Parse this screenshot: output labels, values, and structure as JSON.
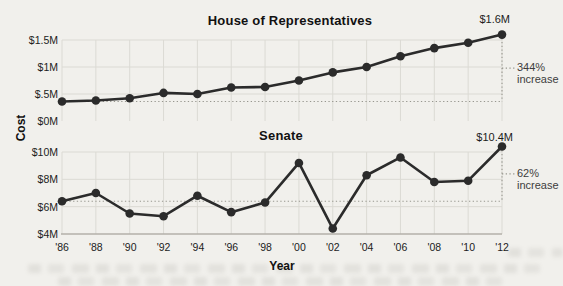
{
  "figure": {
    "y_axis_title": "Cost",
    "x_axis_title": "Year",
    "colors": {
      "line": "#2b2b2b",
      "grid": "#dbdad4",
      "dotted": "#98978f",
      "axis": "#b3b1aa",
      "background": "#f1f0ec"
    }
  },
  "chart_data": [
    {
      "type": "line",
      "title": "House of Representatives",
      "categories": [
        "'86",
        "'88",
        "'90",
        "'92",
        "'94",
        "'96",
        "'98",
        "'00",
        "'02",
        "'04",
        "'06",
        "'08",
        "'10",
        "'12"
      ],
      "x": [
        1986,
        1988,
        1990,
        1992,
        1994,
        1996,
        1998,
        2000,
        2002,
        2004,
        2006,
        2008,
        2010,
        2012
      ],
      "values": [
        0.36,
        0.38,
        0.42,
        0.52,
        0.5,
        0.62,
        0.63,
        0.75,
        0.9,
        1.0,
        1.2,
        1.35,
        1.45,
        1.6
      ],
      "unit": "$M",
      "ylim": [
        0,
        1.5
      ],
      "yticks": {
        "labels": [
          "$1.5M",
          "$1M",
          "$.5M",
          "$0M"
        ],
        "values": [
          1.5,
          1,
          0.5,
          0
        ]
      },
      "grid": true,
      "legend": "none",
      "end_label": "$1.6M",
      "annotation": {
        "pct": "344%",
        "word": "increase"
      }
    },
    {
      "type": "line",
      "title": "Senate",
      "categories": [
        "'86",
        "'88",
        "'90",
        "'92",
        "'94",
        "'96",
        "'98",
        "'00",
        "'02",
        "'04",
        "'06",
        "'08",
        "'10",
        "'12"
      ],
      "x": [
        1986,
        1988,
        1990,
        1992,
        1994,
        1996,
        1998,
        2000,
        2002,
        2004,
        2006,
        2008,
        2010,
        2012
      ],
      "values": [
        6.4,
        7.0,
        5.5,
        5.3,
        6.8,
        5.6,
        6.3,
        9.2,
        4.4,
        8.3,
        9.6,
        7.8,
        7.9,
        10.4
      ],
      "unit": "$M",
      "ylim": [
        4,
        10
      ],
      "yticks": {
        "labels": [
          "$10M",
          "$8M",
          "$6M",
          "$4M"
        ],
        "values": [
          10,
          8,
          6,
          4
        ]
      },
      "grid": true,
      "legend": "none",
      "end_label": "$10.4M",
      "annotation": {
        "pct": "62%",
        "word": "increase"
      }
    }
  ]
}
